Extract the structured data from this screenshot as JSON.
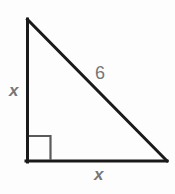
{
  "figure": {
    "kind": "right-triangle-diagram",
    "background_color": "#fdfdfd",
    "stroke_color": "#1a1a1a",
    "label_color": "#767676",
    "width": 175,
    "height": 194,
    "vertices": {
      "apex": [
        27,
        19
      ],
      "right_angle": [
        27,
        161
      ],
      "bottom_right": [
        167,
        161
      ]
    },
    "right_angle_marker": {
      "present": true,
      "size": 23,
      "at": "bottom-left"
    },
    "labels": {
      "vertical_leg": "x",
      "horizontal_leg": "x",
      "hypotenuse": "6"
    }
  }
}
